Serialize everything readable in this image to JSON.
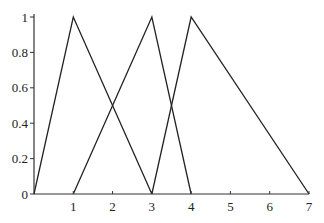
{
  "chart_data": {
    "type": "line",
    "title": "",
    "xlabel": "",
    "ylabel": "",
    "xlim": [
      0,
      7
    ],
    "ylim": [
      0,
      1
    ],
    "grid": false,
    "legend": null,
    "x_ticks": [
      "0",
      "1",
      "2",
      "3",
      "4",
      "5",
      "6",
      "7"
    ],
    "y_ticks": [
      "0",
      "0.2",
      "0.4",
      "0.6",
      "0.8",
      "1"
    ],
    "series": [
      {
        "name": "triangle-1",
        "points": [
          [
            0,
            0
          ],
          [
            1,
            1
          ],
          [
            3,
            0
          ]
        ]
      },
      {
        "name": "triangle-2",
        "points": [
          [
            1,
            0
          ],
          [
            3,
            1
          ],
          [
            4,
            0
          ]
        ]
      },
      {
        "name": "triangle-3",
        "points": [
          [
            3,
            0
          ],
          [
            4,
            1
          ],
          [
            7,
            0
          ]
        ]
      }
    ]
  },
  "layout": {
    "plot_left": 34,
    "plot_right": 309,
    "plot_top": 17,
    "plot_bottom": 194,
    "line_color": "#222222"
  }
}
